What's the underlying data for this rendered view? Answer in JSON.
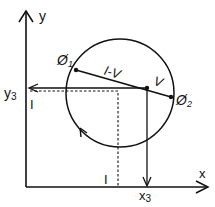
{
  "diagram": {
    "type": "geometric-construction",
    "colors": {
      "stroke": "#111111",
      "background": "#ffffff"
    },
    "axes": {
      "x_label": "x",
      "y_label": "y"
    },
    "circle": {
      "direction": "counterclockwise",
      "points": [
        {
          "id": "phi1",
          "label": "Ø",
          "subscript": "1"
        },
        {
          "id": "phi2",
          "label": "Ø",
          "subscript": "2"
        },
        {
          "id": "v",
          "label": "V"
        }
      ]
    },
    "segments": {
      "phi1_to_v_label": "I-V",
      "v_to_phi2_label": "V"
    },
    "projections": {
      "y3_label": "y",
      "y3_subscript": "3",
      "x3_label": "x",
      "x3_subscript": "3",
      "y_tick_label": "I",
      "x_tick_label": "I"
    }
  }
}
